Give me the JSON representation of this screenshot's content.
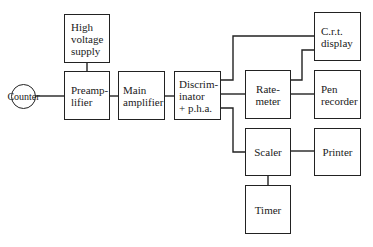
{
  "diagram": {
    "title": "",
    "nodes": [
      {
        "id": "counter",
        "label": "Counter",
        "shape": "circle"
      },
      {
        "id": "hv_supply",
        "label": "High\nvoltage\nsupply"
      },
      {
        "id": "preamp",
        "label": "Preamp-\nlifier"
      },
      {
        "id": "main_amp",
        "label": "Main\namplifier"
      },
      {
        "id": "discriminator",
        "label": "Discrim-\ninator\n+ p.h.a."
      },
      {
        "id": "ratemeter",
        "label": "Rate-\nmeter"
      },
      {
        "id": "crt",
        "label": "C.r.t.\ndisplay"
      },
      {
        "id": "pen_recorder",
        "label": "Pen\nrecorder"
      },
      {
        "id": "scaler",
        "label": "Scaler"
      },
      {
        "id": "printer",
        "label": "Printer"
      },
      {
        "id": "timer",
        "label": "Timer"
      }
    ],
    "edges": [
      [
        "counter",
        "preamp"
      ],
      [
        "hv_supply",
        "preamp"
      ],
      [
        "preamp",
        "main_amp"
      ],
      [
        "main_amp",
        "discriminator"
      ],
      [
        "discriminator",
        "crt"
      ],
      [
        "discriminator",
        "ratemeter"
      ],
      [
        "discriminator",
        "scaler"
      ],
      [
        "ratemeter",
        "crt"
      ],
      [
        "ratemeter",
        "pen_recorder"
      ],
      [
        "scaler",
        "printer"
      ],
      [
        "scaler",
        "timer"
      ]
    ]
  }
}
